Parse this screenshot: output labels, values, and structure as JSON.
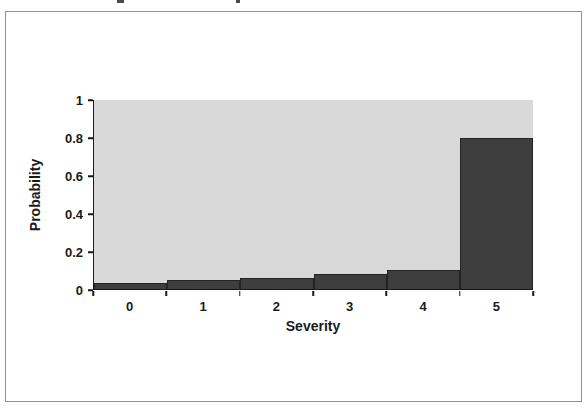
{
  "figure": {
    "frame_color": "#929292",
    "background": "#ffffff"
  },
  "chart_data": {
    "type": "bar",
    "title": "",
    "xlabel": "Severity",
    "ylabel": "Probability",
    "categories": [
      "0",
      "1",
      "2",
      "3",
      "4",
      "5"
    ],
    "values": [
      0.03,
      0.05,
      0.06,
      0.08,
      0.1,
      0.8
    ],
    "ylim": [
      0,
      1
    ],
    "yticks": [
      0,
      0.2,
      0.4,
      0.6,
      0.8,
      1
    ],
    "ytick_labels": [
      "0",
      "0.2",
      "0.4",
      "0.6",
      "0.8",
      "1"
    ],
    "grid": false,
    "legend": null,
    "bar_gap": 0,
    "bar_color": "#3e3e3e",
    "bar_border_color": "#242424",
    "plot_background": "#d9d9d9",
    "axis_color": "#1a1a1a",
    "text_color": "#1a1a1a"
  }
}
